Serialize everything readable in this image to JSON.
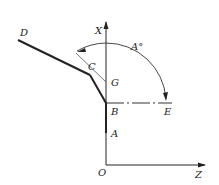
{
  "diagram": {
    "type": "geometry-coordinate-diagram",
    "labels": {
      "x_axis": "X",
      "z_axis": "Z",
      "origin": "O",
      "point_a": "A",
      "point_b": "B",
      "point_c": "C",
      "point_d": "D",
      "point_e": "E",
      "point_g": "G",
      "angle": "A°"
    },
    "colors": {
      "line": "#222222",
      "thin_line": "#555555",
      "background": "#ffffff"
    }
  }
}
